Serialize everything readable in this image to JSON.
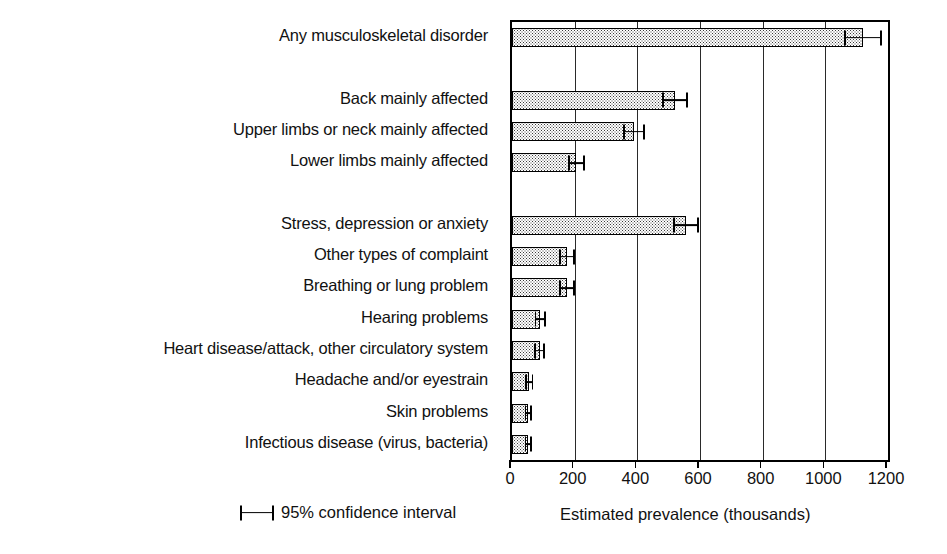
{
  "chart_data": {
    "type": "bar",
    "orientation": "horizontal",
    "title": "",
    "xlabel": "Estimated prevalence (thousands)",
    "ylabel": "",
    "xlim": [
      0,
      1200
    ],
    "xticks": [
      0,
      200,
      400,
      600,
      800,
      1000,
      1200
    ],
    "xtick_labels": [
      "0",
      "200",
      "400",
      "600",
      "800",
      "1000",
      "1200"
    ],
    "grid": "vertical gridlines at each x tick",
    "legend": {
      "position": "below-left",
      "entries": [
        "95% confidence interval"
      ]
    },
    "error_bars": "95% confidence interval",
    "categories": [
      "Any musculoskeletal disorder",
      "Back mainly affected",
      "Upper limbs or neck mainly affected",
      "Lower limbs mainly affected",
      "Stress, depression or anxiety",
      "Other types of complaint",
      "Breathing or lung problem",
      "Hearing problems",
      "Heart disease/attack, other circulatory system",
      "Headache and/or eyestrain",
      "Skin problems",
      "Infectious disease (virus, bacteria)"
    ],
    "values": [
      1120,
      520,
      390,
      205,
      555,
      175,
      175,
      90,
      88,
      55,
      52,
      52
    ],
    "ci_low": [
      1060,
      480,
      355,
      178,
      515,
      150,
      150,
      72,
      70,
      42,
      40,
      40
    ],
    "ci_high": [
      1180,
      562,
      425,
      232,
      596,
      200,
      200,
      108,
      106,
      68,
      64,
      64
    ],
    "row_slots": [
      0,
      2,
      3,
      4,
      6,
      7,
      8,
      9,
      10,
      11,
      12,
      13
    ],
    "row_count": 14
  },
  "labels": {
    "items": [
      "Any musculoskeletal disorder",
      "Back mainly affected",
      "Upper limbs or neck mainly affected",
      "Lower limbs mainly affected",
      "Stress, depression or anxiety",
      "Other types of complaint",
      "Breathing or lung problem",
      "Hearing problems",
      "Heart disease/attack, other circulatory system",
      "Headache and/or eyestrain",
      "Skin problems",
      "Infectious disease (virus, bacteria)"
    ]
  },
  "axis": {
    "tick_labels": [
      "0",
      "200",
      "400",
      "600",
      "800",
      "1000",
      "1200"
    ],
    "x_axis_title": "Estimated prevalence (thousands)"
  },
  "legend": {
    "ci_label": "95% confidence interval"
  },
  "colors": {
    "ink": "#111111",
    "bar_border": "#000000",
    "bar_fill": "#ffffff",
    "bar_stipple": "#3a3a3a",
    "gridline": "#2a2a2a",
    "background": "#ffffff"
  }
}
